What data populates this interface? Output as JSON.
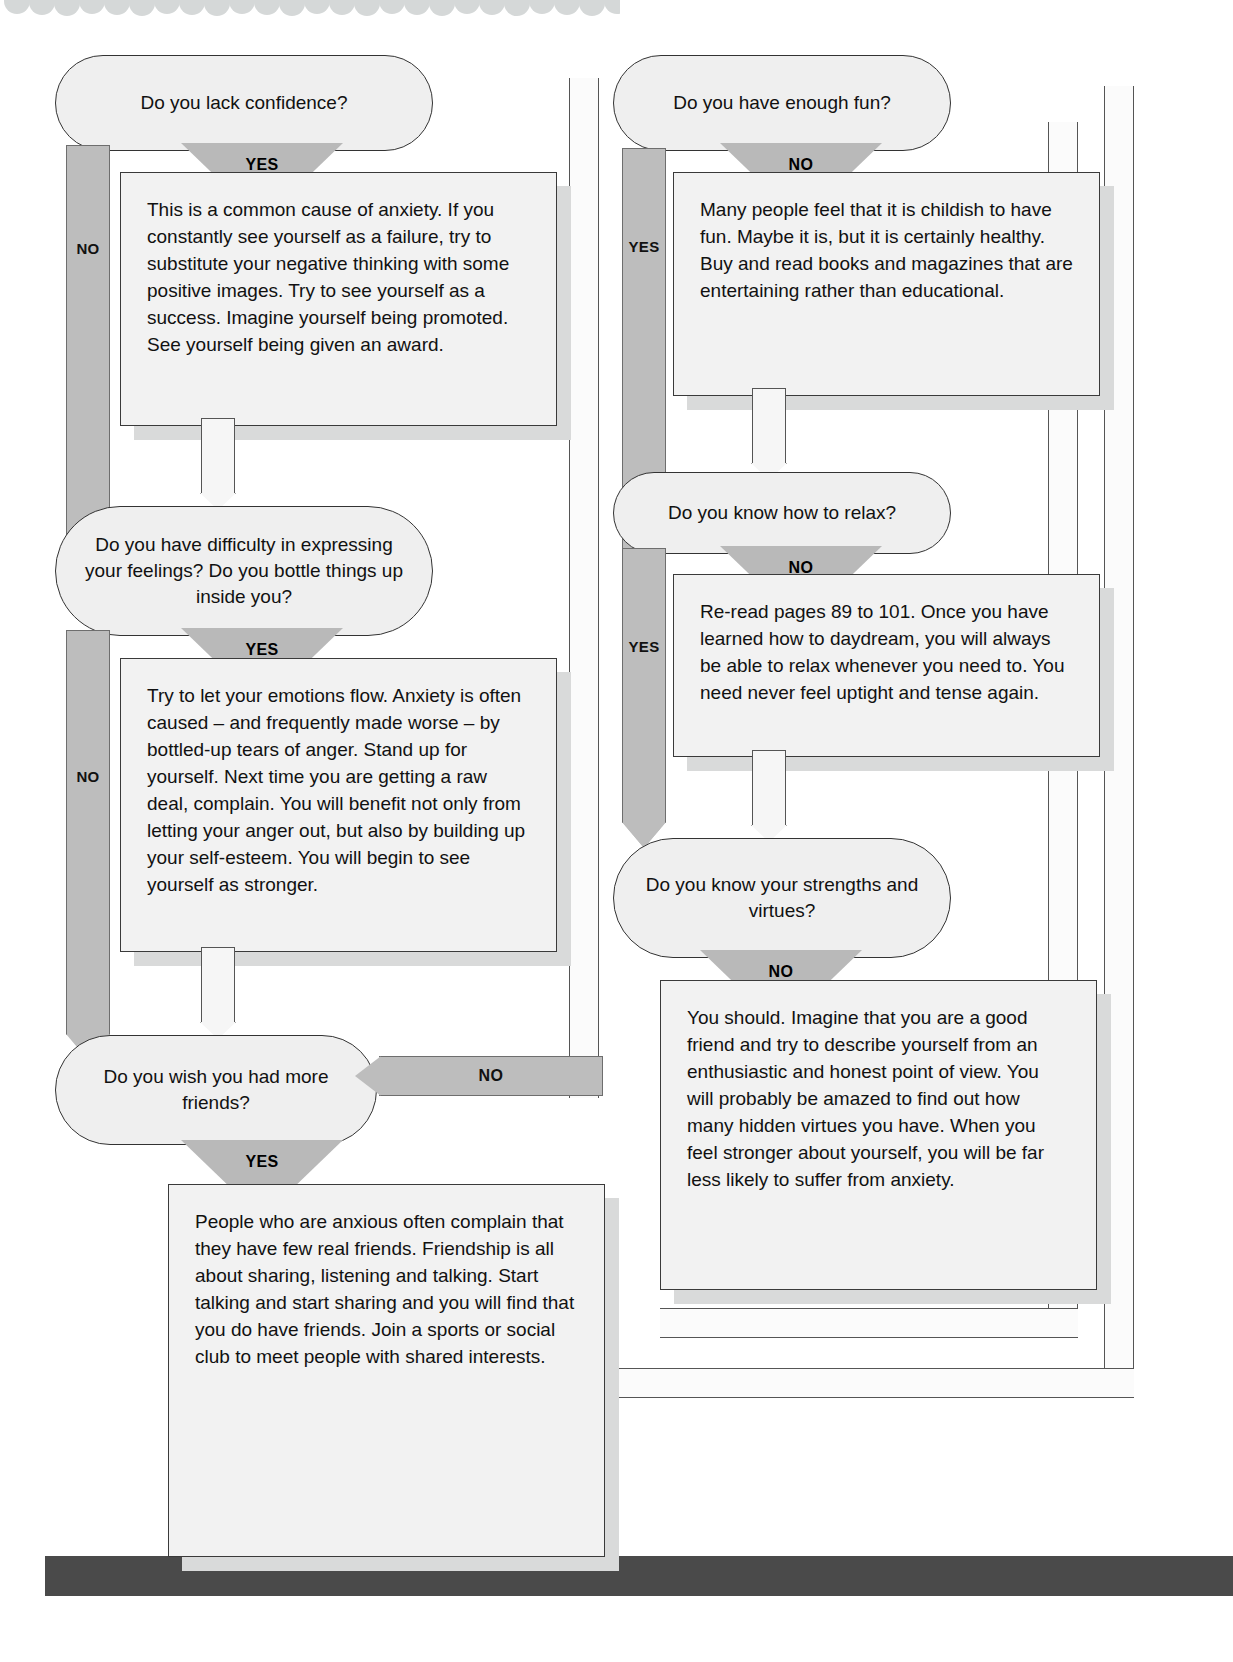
{
  "page": {
    "colors": {
      "capsule_fill": "#efefef",
      "box_fill": "#f2f2f2",
      "arrow_gray": "#bdbdbd",
      "triangle_gray": "#b9b9b9",
      "shadow": "#d9dada",
      "bottom_bar": "#4a4a4a",
      "outline": "#333333"
    }
  },
  "labels": {
    "yes": "YES",
    "no": "NO"
  },
  "left_column": {
    "q1": {
      "text": "Do you lack confidence?",
      "yes_label": "YES",
      "no_label": "NO"
    },
    "a1": {
      "text": "This is a common cause of anxiety. If you constantly see yourself as a failure, try to substitute your negative thinking with some positive images. Try to see yourself as a success. Imagine yourself being promoted. See yourself being given an award."
    },
    "q2": {
      "text": "Do you have difficulty in expressing your feelings? Do you bottle things up inside you?",
      "yes_label": "YES",
      "no_label": "NO"
    },
    "a2": {
      "text": "Try to let your emotions flow. Anxiety is often caused – and frequently made worse – by bottled-up tears of anger. Stand up for yourself. Next time you are getting a raw deal, complain. You will benefit not only from letting your anger out, but also by building up your self-esteem. You will begin to see yourself as stronger."
    },
    "q3": {
      "text": "Do you wish you had more friends?",
      "yes_label": "YES",
      "no_label": "NO"
    },
    "a3": {
      "text": "People who are anxious often complain that they have few real friends. Friendship is all about sharing, listening and talking. Start talking and start sharing and you will find that you do have friends. Join a sports or social club to meet people with shared interests."
    }
  },
  "right_column": {
    "q4": {
      "text": "Do you have enough fun?",
      "no_label": "NO",
      "yes_label": "YES"
    },
    "a4": {
      "text": "Many people feel that it is childish to have fun. Maybe it is, but it is certainly healthy. Buy and read books and magazines that are entertaining rather than educational."
    },
    "q5": {
      "text": "Do you know how to relax?",
      "no_label": "NO",
      "yes_label": "YES"
    },
    "a5": {
      "text": "Re-read pages 89 to 101. Once you have learned how to daydream, you will always be able to relax whenever you need to. You need never feel uptight and tense again."
    },
    "q6": {
      "text": "Do you know your strengths and virtues?",
      "no_label": "NO"
    },
    "a6": {
      "text": "You should. Imagine that you are a good friend and try to describe yourself from an enthusiastic and honest point of view. You will probably be amazed to find out how many hidden virtues you have. When you feel stronger about yourself, you will be far less likely to suffer from anxiety."
    }
  }
}
